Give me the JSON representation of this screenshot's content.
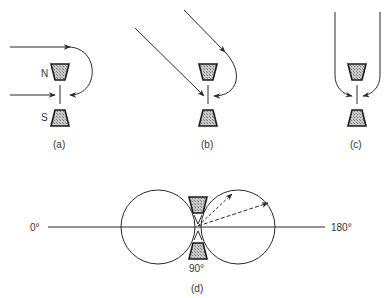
{
  "figure": {
    "panels": [
      {
        "id": "a",
        "caption": "(a)",
        "pole_top": "N",
        "pole_bottom": "S"
      },
      {
        "id": "b",
        "caption": "(b)"
      },
      {
        "id": "c",
        "caption": "(c)"
      },
      {
        "id": "d",
        "caption": "(d)",
        "angle_left": "0°",
        "angle_right": "180°",
        "angle_bottom": "90°"
      }
    ]
  },
  "colors": {
    "line": "#2a2a2a",
    "magnet_fill": "#b0b0b0",
    "background": "#ffffff"
  }
}
